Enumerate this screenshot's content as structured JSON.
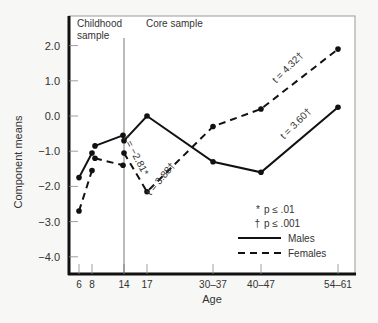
{
  "chart_data": {
    "type": "line",
    "title": "",
    "xlabel": "Age",
    "ylabel": "Component means",
    "ylim": [
      -4.5,
      2.8
    ],
    "yticks": [
      "2.0",
      "1.0",
      "0.0",
      "-1.0",
      "-2.0",
      "-3.0",
      "-4.0"
    ],
    "ytick_values": [
      2,
      1,
      0,
      -1,
      -2,
      -3,
      -4
    ],
    "xticks": [
      {
        "label": "6",
        "px": 79
      },
      {
        "label": "8",
        "px": 92
      },
      {
        "label": "14",
        "px": 124
      },
      {
        "label": "17",
        "px": 147
      },
      {
        "label": "30–37",
        "px": 213
      },
      {
        "label": "40–47",
        "px": 261
      },
      {
        "label": "54–61",
        "px": 338
      }
    ],
    "regions": [
      {
        "label_line1": "Childhood",
        "label_line2": "sample"
      },
      {
        "label_line1": "Core sample"
      }
    ],
    "divider_age": "14",
    "grid": false,
    "series": [
      {
        "name": "Males",
        "style": "solid",
        "segments": [
          [
            [
              "6",
              -1.75
            ],
            [
              "8",
              -1.05
            ]
          ],
          [
            [
              "8",
              -0.85
            ],
            [
              "14",
              -0.55
            ]
          ],
          [
            [
              "14",
              -0.7
            ],
            [
              "17",
              0.0
            ],
            [
              "30–37",
              -1.3
            ],
            [
              "40–47",
              -1.6
            ],
            [
              "54–61",
              0.25
            ]
          ]
        ]
      },
      {
        "name": "Females",
        "style": "dashed",
        "segments": [
          [
            [
              "6",
              -2.7
            ],
            [
              "8",
              -1.55
            ]
          ],
          [
            [
              "8",
              -1.2
            ],
            [
              "14",
              -1.4
            ]
          ],
          [
            [
              "14",
              -1.05
            ],
            [
              "17",
              -2.15
            ],
            [
              "30–37",
              -0.3
            ],
            [
              "40–47",
              0.2
            ],
            [
              "54–61",
              1.9
            ]
          ]
        ]
      }
    ],
    "annotations": [
      {
        "text": "t = −2.81*",
        "x_px": 133,
        "y_px": 157,
        "angle": 62
      },
      {
        "text": "t = 3.88†",
        "x_px": 163,
        "y_px": 181,
        "angle": -50
      },
      {
        "text": "t = 4.32†",
        "x_px": 290,
        "y_px": 70,
        "angle": -45
      },
      {
        "text": "t = 3.60†",
        "x_px": 298,
        "y_px": 126,
        "angle": -45
      }
    ],
    "legend": {
      "position": "lower right",
      "entries": [
        {
          "symbol": "*",
          "label": "p ≤ .01"
        },
        {
          "symbol": "†",
          "label": "p ≤ .001"
        },
        {
          "symbol": "solid-line",
          "label": "Males"
        },
        {
          "symbol": "dashed-line",
          "label": "Females"
        }
      ]
    }
  }
}
